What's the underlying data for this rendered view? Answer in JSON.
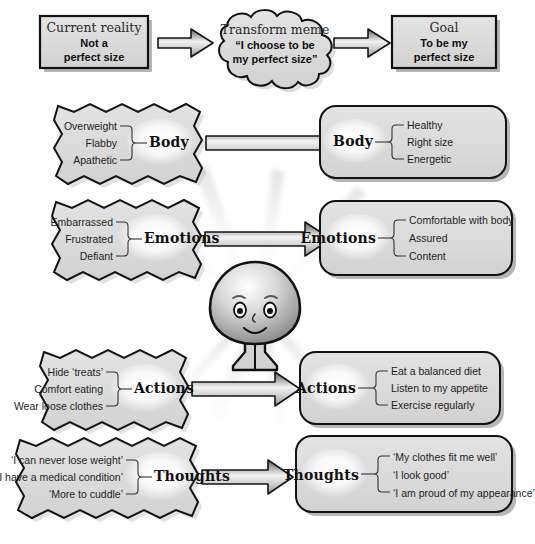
{
  "diagram": {
    "background_color": "#ffffff",
    "box_fill": "#dcdcdc",
    "box_stroke": "#1a1a1a",
    "shadow_color": "#b5b5b5"
  },
  "top_row": {
    "current": {
      "title": "Current reality",
      "line1": "Not a",
      "line2": "perfect size",
      "shape": "rectangle"
    },
    "transform": {
      "title": "Transform meme",
      "line1": "“I choose to be",
      "line2": "my perfect size”",
      "shape": "cloud"
    },
    "goal": {
      "title": "Goal",
      "line1": "To be my",
      "line2": "perfect size",
      "shape": "rectangle"
    },
    "arrow_left": "arrow-right-icon",
    "arrow_right": "arrow-right-icon"
  },
  "rows": [
    {
      "key": "body",
      "left": {
        "label": "Body",
        "shape": "torn-edge",
        "items": [
          "Overweight",
          "Flabby",
          "Apathetic"
        ]
      },
      "right": {
        "label": "Body",
        "shape": "rounded-rect",
        "items": [
          "Healthy",
          "Right size",
          "Energetic"
        ]
      },
      "arrow": "arrow-right-icon"
    },
    {
      "key": "emotions",
      "left": {
        "label": "Emotions",
        "shape": "torn-edge",
        "items": [
          "Embarrassed",
          "Frustrated",
          "Defiant"
        ]
      },
      "right": {
        "label": "Emotions",
        "shape": "rounded-rect",
        "items": [
          "Comfortable with body",
          "Assured",
          "Content"
        ]
      },
      "arrow": "arrow-right-icon"
    },
    {
      "key": "actions",
      "left": {
        "label": "Actions",
        "shape": "torn-edge",
        "items": [
          "Hide ‘treats’",
          "Comfort eating",
          "Wear loose clothes"
        ]
      },
      "right": {
        "label": "Actions",
        "shape": "rounded-rect",
        "items": [
          "Eat a balanced diet",
          "Listen to my appetite",
          "Exercise regularly"
        ]
      },
      "arrow": "arrow-right-icon"
    },
    {
      "key": "thoughts",
      "left": {
        "label": "Thoughts",
        "shape": "torn-edge",
        "items": [
          "‘I can never lose weight’",
          "‘I have a medical condition’",
          "‘More to cuddle’"
        ]
      },
      "right": {
        "label": "Thoughts",
        "shape": "rounded-rect",
        "items": [
          "‘My clothes fit me well’",
          "‘I look good’",
          "‘I am proud of my appearance’"
        ]
      },
      "arrow": "arrow-right-icon"
    }
  ],
  "center_figure": {
    "name": "smiling-person-figure",
    "description": "Cartoon character with round head, eyes, eyebrows, nose, smile, ears, neck and flared base"
  }
}
